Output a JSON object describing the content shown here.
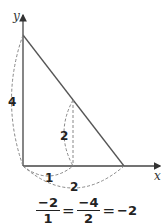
{
  "diagram": {
    "axes": {
      "x_label": "x",
      "y_label": "y"
    },
    "labels": {
      "vertical_big": "4",
      "vertical_small": "2",
      "horizontal_small": "1",
      "horizontal_big": "2"
    },
    "equation": {
      "frac1": {
        "num": "−2",
        "den": "1"
      },
      "eq1": "=",
      "frac2": {
        "num": "−4",
        "den": "2"
      },
      "eq2": "=",
      "result": "−2"
    },
    "colors": {
      "line": "#555555",
      "dash": "#888888",
      "text": "#222222"
    }
  }
}
